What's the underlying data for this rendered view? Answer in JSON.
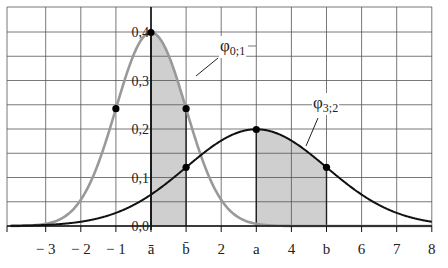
{
  "chart_data": {
    "type": "line",
    "title": "",
    "xlabel": "",
    "ylabel": "",
    "xlim": [
      -3.5,
      8
    ],
    "ylim": [
      0,
      0.45
    ],
    "grid": true,
    "x_ticks": [
      {
        "value": -3,
        "label": "− 3"
      },
      {
        "value": -2,
        "label": "− 2"
      },
      {
        "value": -1,
        "label": "− 1"
      },
      {
        "value": 0,
        "label": "ā"
      },
      {
        "value": 1,
        "label": "b̄"
      },
      {
        "value": 2,
        "label": "2"
      },
      {
        "value": 3,
        "label": "a"
      },
      {
        "value": 4,
        "label": "4"
      },
      {
        "value": 5,
        "label": "b"
      },
      {
        "value": 6,
        "label": "6"
      },
      {
        "value": 7,
        "label": "7"
      },
      {
        "value": 8,
        "label": "8"
      }
    ],
    "y_ticks": [
      {
        "value": 0.0,
        "label": "0,0"
      },
      {
        "value": 0.1,
        "label": "0,1"
      },
      {
        "value": 0.2,
        "label": "0,2"
      },
      {
        "value": 0.3,
        "label": "0,3"
      },
      {
        "value": 0.4,
        "label": "0,4"
      }
    ],
    "series": [
      {
        "name": "φ0;1",
        "label_main": "φ",
        "label_sub": "0;1",
        "mu": 0,
        "sigma": 1,
        "color": "#999999",
        "shade_from": 0,
        "shade_to": 1,
        "marked_points": [
          [
            -1,
            0.242
          ],
          [
            0,
            0.399
          ],
          [
            1,
            0.242
          ]
        ]
      },
      {
        "name": "φ3;2",
        "label_main": "φ",
        "label_sub": "3;2",
        "mu": 3,
        "sigma": 2,
        "color": "#111111",
        "shade_from": 3,
        "shade_to": 5,
        "marked_points": [
          [
            1,
            0.121
          ],
          [
            3,
            0.199
          ],
          [
            5,
            0.121
          ]
        ]
      }
    ],
    "annotations": [
      {
        "text": "φ0;1",
        "points_to": [
          1.0,
          0.3
        ]
      },
      {
        "text": "φ3;2",
        "points_to": [
          4.5,
          0.16
        ]
      }
    ]
  }
}
